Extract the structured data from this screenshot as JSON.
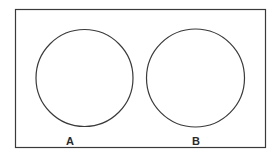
{
  "diagram": {
    "type": "venn-disjoint",
    "frame": {
      "x": 15,
      "y": 9,
      "width": 250,
      "height": 138,
      "stroke": "#3a3a3a"
    },
    "sets": [
      {
        "label": "A",
        "cx": 84.5,
        "cy": 78,
        "r": 48.5,
        "label_x": 70,
        "label_y": 145
      },
      {
        "label": "B",
        "cx": 195.5,
        "cy": 78,
        "r": 49,
        "label_x": 196,
        "label_y": 145
      }
    ],
    "stroke_color": "#3a3a3a"
  }
}
